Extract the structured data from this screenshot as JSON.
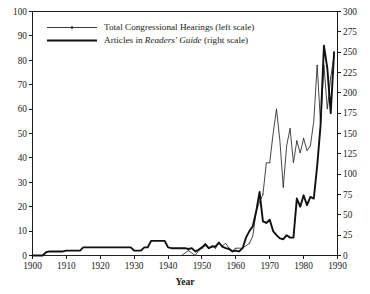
{
  "chart_data": {
    "type": "line",
    "title": "",
    "xlabel": "Year",
    "ylabel": "",
    "xlim": [
      1900,
      1990
    ],
    "ylim": [
      0,
      100
    ],
    "y2lim": [
      0,
      300
    ],
    "grid": false,
    "legend_position": "top-left",
    "xticks": [
      1900,
      1910,
      1920,
      1930,
      1940,
      1950,
      1960,
      1970,
      1980,
      1990
    ],
    "xticklabels": [
      "1900",
      "1910",
      "1920",
      "1930",
      "1940",
      "1950",
      "1960",
      "1970",
      "1980",
      "1990"
    ],
    "yticks": [
      0,
      10,
      20,
      30,
      40,
      50,
      60,
      70,
      80,
      90,
      100
    ],
    "yticklabels": [
      "0",
      "10",
      "20",
      "30",
      "40",
      "50",
      "60",
      "70",
      "80",
      "90",
      "100"
    ],
    "y2ticks": [
      0,
      25,
      50,
      75,
      100,
      125,
      150,
      175,
      200,
      225,
      250,
      275,
      300
    ],
    "y2ticklabels": [
      "0",
      "25",
      "50",
      "75",
      "100",
      "125",
      "150",
      "175",
      "200",
      "225",
      "250",
      "275",
      "300"
    ],
    "legend": [
      {
        "label": "Total Congressional Hearings (left scale)",
        "label_pre": "Total Congressional Hearings (left scale)",
        "label_italic": "",
        "label_post": "",
        "style": "thin-with-marker",
        "axis": "left",
        "color": "#262626"
      },
      {
        "label": "Articles in Readers' Guide (right scale)",
        "label_pre": "Articles in ",
        "label_italic": "Readers' Guide",
        "label_post": " (right scale)",
        "style": "thick",
        "axis": "right",
        "color": "#111111"
      }
    ],
    "x": [
      1900,
      1901,
      1902,
      1903,
      1904,
      1905,
      1906,
      1907,
      1908,
      1909,
      1910,
      1911,
      1912,
      1913,
      1914,
      1915,
      1916,
      1917,
      1918,
      1919,
      1920,
      1921,
      1922,
      1923,
      1924,
      1925,
      1926,
      1927,
      1928,
      1929,
      1930,
      1931,
      1932,
      1933,
      1934,
      1935,
      1936,
      1937,
      1938,
      1939,
      1940,
      1941,
      1942,
      1943,
      1944,
      1945,
      1946,
      1947,
      1948,
      1949,
      1950,
      1951,
      1952,
      1953,
      1954,
      1955,
      1956,
      1957,
      1958,
      1959,
      1960,
      1961,
      1962,
      1963,
      1964,
      1965,
      1966,
      1967,
      1968,
      1969,
      1970,
      1971,
      1972,
      1973,
      1974,
      1975,
      1976,
      1977,
      1978,
      1979,
      1980,
      1981,
      1982,
      1983,
      1984,
      1985,
      1986,
      1987,
      1988,
      1989
    ],
    "series": [
      {
        "name": "Total Congressional Hearings (left scale)",
        "axis": "left",
        "values": [
          0,
          0,
          0,
          0,
          0,
          0,
          0,
          0,
          0,
          0,
          0,
          0,
          0,
          0,
          0,
          0,
          0,
          0,
          0,
          0,
          0,
          0,
          0,
          0,
          0,
          0,
          0,
          0,
          0,
          0,
          0,
          0,
          0,
          0,
          0,
          0,
          0,
          0,
          0,
          0,
          0,
          0,
          0,
          0,
          0,
          1,
          2,
          1,
          0,
          2,
          3,
          4,
          3,
          4,
          3,
          5,
          4,
          5,
          3,
          2,
          3,
          3,
          3,
          4,
          5,
          8,
          18,
          22,
          25,
          38,
          38,
          50,
          60,
          47,
          28,
          45,
          52,
          38,
          47,
          42,
          48,
          43,
          45,
          55,
          78,
          54,
          78,
          60,
          73,
          82
        ]
      },
      {
        "name": "Articles in Readers' Guide (right scale)",
        "axis": "right",
        "values": [
          0,
          0,
          0,
          0,
          4,
          5,
          5,
          5,
          5,
          5,
          6,
          6,
          6,
          6,
          6,
          10,
          10,
          10,
          10,
          10,
          10,
          10,
          10,
          10,
          10,
          10,
          10,
          10,
          10,
          10,
          6,
          6,
          6,
          10,
          10,
          18,
          18,
          18,
          18,
          18,
          10,
          9,
          9,
          9,
          9,
          9,
          8,
          9,
          5,
          7,
          10,
          14,
          9,
          11,
          11,
          16,
          11,
          9,
          8,
          5,
          6,
          5,
          9,
          22,
          30,
          36,
          54,
          78,
          42,
          40,
          44,
          30,
          25,
          21,
          20,
          25,
          22,
          22,
          70,
          60,
          74,
          62,
          72,
          70,
          110,
          160,
          258,
          230,
          175,
          250
        ]
      }
    ]
  }
}
